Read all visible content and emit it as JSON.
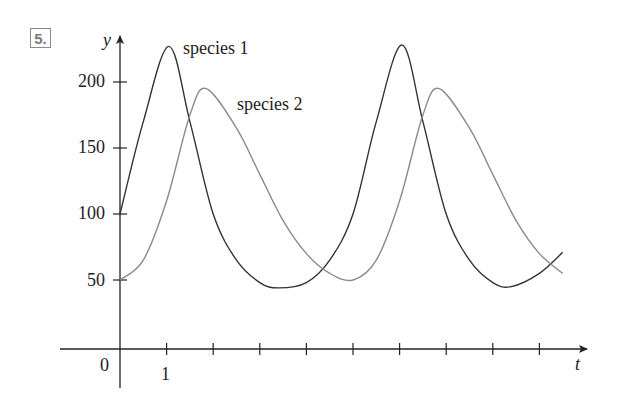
{
  "problem_number": "5.",
  "chart_data": {
    "type": "line",
    "title": "",
    "xlabel": "t",
    "ylabel": "y",
    "xlim": [
      -1.2,
      10
    ],
    "ylim": [
      0,
      240
    ],
    "grid": false,
    "x_ticks": [
      1,
      2,
      3,
      4,
      5,
      6,
      7,
      8,
      9
    ],
    "x_tick_labels": [
      {
        "value": 0,
        "label": "0"
      },
      {
        "value": 1,
        "label": "1"
      }
    ],
    "y_ticks": [
      50,
      100,
      150,
      200
    ],
    "y_tick_labels": [
      "50",
      "100",
      "150",
      "200"
    ],
    "legend": "inline labels",
    "annotations": [
      {
        "text": "species 1",
        "near_series": "species 1",
        "x": 1.4,
        "y": 228
      },
      {
        "text": "species 2",
        "near_series": "species 2",
        "x": 2.5,
        "y": 180
      }
    ],
    "series": [
      {
        "name": "species 1",
        "color": "#333333",
        "x": [
          0,
          0.5,
          1.05,
          1.5,
          2,
          2.5,
          3,
          3.4,
          4,
          4.5,
          5,
          5.5,
          6.05,
          6.5,
          7,
          7.5,
          8,
          8.4,
          9,
          9.5
        ],
        "values": [
          100,
          170,
          227,
          170,
          100,
          65,
          48,
          44,
          48,
          65,
          100,
          170,
          228,
          170,
          100,
          65,
          48,
          45,
          55,
          71
        ]
      },
      {
        "name": "species 2",
        "color": "#8a8a8a",
        "x": [
          0,
          0.5,
          1,
          1.5,
          1.85,
          2.5,
          3,
          3.5,
          4,
          4.5,
          5,
          5.5,
          6,
          6.5,
          6.85,
          7.5,
          8,
          8.5,
          9,
          9.5
        ],
        "values": [
          50,
          65,
          110,
          175,
          195,
          165,
          130,
          95,
          70,
          55,
          50,
          65,
          110,
          175,
          195,
          165,
          130,
          95,
          70,
          55
        ]
      }
    ]
  }
}
